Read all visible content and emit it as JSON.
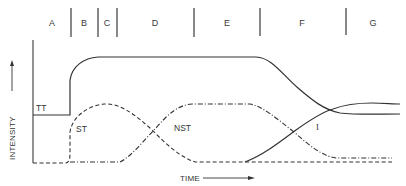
{
  "diagram": {
    "regions": [
      {
        "label": "A",
        "x": 52
      },
      {
        "label": "B",
        "x": 84
      },
      {
        "label": "C",
        "x": 107
      },
      {
        "label": "D",
        "x": 155
      },
      {
        "label": "E",
        "x": 227
      },
      {
        "label": "F",
        "x": 302
      },
      {
        "label": "G",
        "x": 373
      }
    ],
    "dividers_x": [
      71,
      98,
      117,
      194,
      260,
      346
    ],
    "axes": {
      "y_label": "INTENSITY",
      "x_label": "TIME"
    },
    "curves": [
      {
        "label": "TT",
        "style": "solid"
      },
      {
        "label": "ST",
        "style": "dashed"
      },
      {
        "label": "NST",
        "style": "dash-dot"
      },
      {
        "label": "I",
        "style": "solid"
      }
    ],
    "colors": {
      "line": "#333333",
      "background": "#ffffff"
    }
  }
}
